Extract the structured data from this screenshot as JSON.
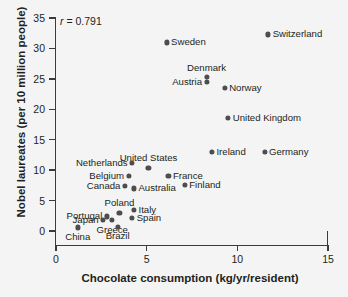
{
  "chart_data": {
    "type": "scatter",
    "title": "",
    "xlabel": "Chocolate consumption (kg/yr/resident)",
    "ylabel": "Nobel laureates (per 10 million people)",
    "xlim": [
      0,
      15
    ],
    "ylim": [
      0,
      35
    ],
    "xticks": [
      "0",
      "5",
      "10",
      "15"
    ],
    "xtick_values": [
      0,
      5,
      10,
      15
    ],
    "yticks": [
      "0",
      "5",
      "10",
      "15",
      "20",
      "25",
      "30",
      "35"
    ],
    "ytick_values": [
      0,
      5,
      10,
      15,
      20,
      25,
      30,
      35
    ],
    "grid": false,
    "legend": "none",
    "annotation": {
      "symbol": "r",
      "equals": " = ",
      "value": "0.791",
      "full_text": "r = 0.791"
    },
    "marker_color": "#4d4d4d",
    "axis_color": "#3b3b3b",
    "background_color": "#f4f4f4",
    "points": [
      {
        "label": "Switzerland",
        "x": 11.7,
        "y": 32.3,
        "label_pos": "right"
      },
      {
        "label": "Sweden",
        "x": 6.1,
        "y": 31.0,
        "label_pos": "right"
      },
      {
        "label": "Denmark",
        "x": 8.3,
        "y": 25.3,
        "label_pos": "above"
      },
      {
        "label": "Austria",
        "x": 8.3,
        "y": 24.5,
        "label_pos": "left"
      },
      {
        "label": "Norway",
        "x": 9.3,
        "y": 23.5,
        "label_pos": "right"
      },
      {
        "label": "United Kingdom",
        "x": 9.5,
        "y": 18.6,
        "label_pos": "right"
      },
      {
        "label": "Ireland",
        "x": 8.6,
        "y": 13.0,
        "label_pos": "right"
      },
      {
        "label": "Germany",
        "x": 11.5,
        "y": 13.0,
        "label_pos": "right"
      },
      {
        "label": "Netherlands",
        "x": 4.2,
        "y": 11.2,
        "label_pos": "left"
      },
      {
        "label": "United States",
        "x": 5.1,
        "y": 10.4,
        "label_pos": "above"
      },
      {
        "label": "Belgium",
        "x": 4.0,
        "y": 9.0,
        "label_pos": "left"
      },
      {
        "label": "France",
        "x": 6.2,
        "y": 9.0,
        "label_pos": "right"
      },
      {
        "label": "Finland",
        "x": 7.1,
        "y": 7.6,
        "label_pos": "right"
      },
      {
        "label": "Canada",
        "x": 3.8,
        "y": 7.4,
        "label_pos": "left"
      },
      {
        "label": "Australia",
        "x": 4.3,
        "y": 7.0,
        "label_pos": "right"
      },
      {
        "label": "Italy",
        "x": 4.3,
        "y": 3.4,
        "label_pos": "right"
      },
      {
        "label": "Poland",
        "x": 3.5,
        "y": 3.0,
        "label_pos": "above"
      },
      {
        "label": "Spain",
        "x": 4.2,
        "y": 2.2,
        "label_pos": "right"
      },
      {
        "label": "Portugal",
        "x": 2.8,
        "y": 2.4,
        "label_pos": "left"
      },
      {
        "label": "Japan",
        "x": 2.6,
        "y": 1.8,
        "label_pos": "left"
      },
      {
        "label": "Greece",
        "x": 3.1,
        "y": 1.8,
        "label_pos": "below"
      },
      {
        "label": "Brazil",
        "x": 3.4,
        "y": 0.7,
        "label_pos": "below"
      },
      {
        "label": "China",
        "x": 1.2,
        "y": 0.6,
        "label_pos": "below"
      }
    ]
  }
}
